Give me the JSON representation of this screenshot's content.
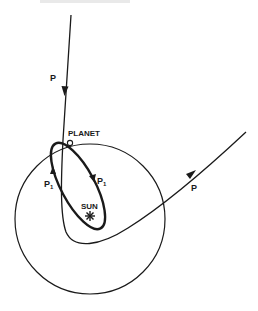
{
  "figure": {
    "type": "orbital-diagram",
    "labels": {
      "incoming_path": "P",
      "outgoing_path": "P",
      "planet": "PLANET",
      "sun": "SUN",
      "captured_orbit_left": "P",
      "captured_orbit_left_sub": "1",
      "captured_orbit_right": "P",
      "captured_orbit_right_sub": "1"
    },
    "elements": [
      "incoming trajectory of body P with downward arrow",
      "planet orbit circle centered on the sun",
      "planet marker (small circle) on orbit",
      "captured elliptical orbit P1 around the sun (bold)",
      "outgoing hyperbolic trajectory of P with arrow",
      "sun marker (star)"
    ],
    "colors": {
      "ink": "#1a1a1a",
      "background": "#ffffff"
    }
  }
}
